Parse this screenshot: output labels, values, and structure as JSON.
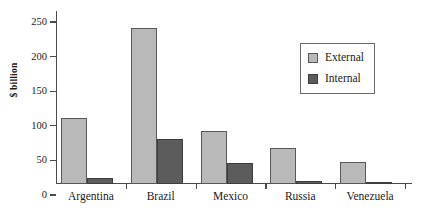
{
  "chart_data": {
    "type": "bar",
    "title": "",
    "xlabel": "",
    "ylabel": "$ billion",
    "ylim": [
      0,
      250
    ],
    "yticks": [
      0,
      50,
      100,
      150,
      200,
      250
    ],
    "grid": false,
    "legend_position": "top-right",
    "categories": [
      "Argentina",
      "Brazil",
      "Mexico",
      "Russia",
      "Venezuela"
    ],
    "series": [
      {
        "name": "External",
        "color": "#b9b9b9",
        "values": [
          95,
          225,
          77,
          52,
          32
        ]
      },
      {
        "name": "Internal",
        "color": "#5c5c5c",
        "values": [
          8,
          65,
          30,
          5,
          1
        ]
      }
    ]
  },
  "axis": {
    "y_label": "$ billion",
    "y_tick_labels": [
      "0",
      "50",
      "100",
      "150",
      "200",
      "250"
    ]
  },
  "legend": {
    "entries": [
      {
        "label": "External"
      },
      {
        "label": "Internal"
      }
    ]
  }
}
